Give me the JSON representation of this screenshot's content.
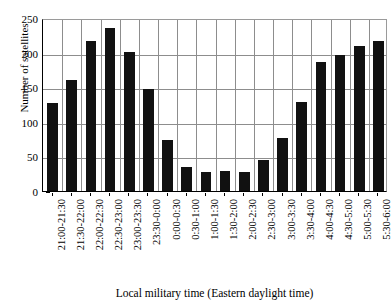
{
  "chart_data": {
    "type": "bar",
    "title": "",
    "xlabel": "Local military time (Eastern daylight time)",
    "ylabel": "Number of satellites",
    "ylim": [
      0,
      250
    ],
    "yticks": [
      0,
      50,
      100,
      150,
      200,
      250
    ],
    "grid": "both",
    "legend": "none",
    "bar_color": "#111111",
    "grid_color": "#8d8d8d",
    "axis_color": "#000000",
    "categories": [
      "21:00-21:30",
      "21:30-22:00",
      "22:00-22:30",
      "22:30-23:00",
      "23:00-23:30",
      "23:30-0:00",
      "0:00-0:30",
      "0:30-1:00",
      "1:00-1:30",
      "1:30-2:00",
      "2:00-2:30",
      "2:30-3:00",
      "3:00-3:30",
      "3:30-4:00",
      "4:00-4:30",
      "4:30-5:00",
      "5:00-5:30",
      "5:30-6:00"
    ],
    "values": [
      127,
      160,
      217,
      236,
      201,
      147,
      73,
      35,
      28,
      29,
      27,
      45,
      76,
      129,
      186,
      196,
      209,
      217
    ]
  }
}
